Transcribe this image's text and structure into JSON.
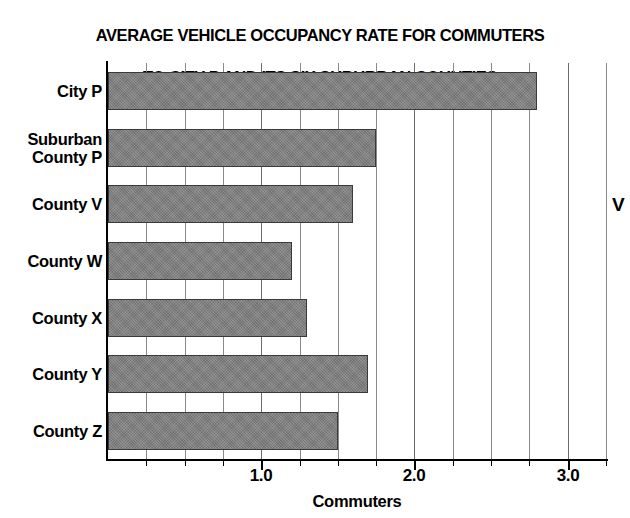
{
  "chart_data": {
    "type": "bar",
    "orientation": "horizontal",
    "title": "AVERAGE VEHICLE OCCUPANCY RATE FOR COMMUTERS TO CITY P AND ITS SIX SUBURBAN COUNTIES",
    "title_lines": [
      "AVERAGE VEHICLE OCCUPANCY RATE FOR COMMUTERS",
      "TO CITY P AND ITS SIX SUBURBAN COUNTIES"
    ],
    "categories": [
      "City P",
      "Suburban County P",
      "County V",
      "County W",
      "County X",
      "County Y",
      "County Z"
    ],
    "category_lines": [
      [
        "City P"
      ],
      [
        "Suburban",
        "County P"
      ],
      [
        "County V"
      ],
      [
        "County W"
      ],
      [
        "County X"
      ],
      [
        "County Y"
      ],
      [
        "County Z"
      ]
    ],
    "values": [
      2.8,
      1.75,
      1.6,
      1.2,
      1.3,
      1.7,
      1.5
    ],
    "xlabel": "Commuters",
    "ylabel": "",
    "xlim": [
      0,
      3.25
    ],
    "xticks": [
      1.0,
      2.0,
      3.0
    ],
    "xtick_labels": [
      "1.0",
      "2.0",
      "3.0"
    ],
    "minor_tick_step": 0.25,
    "grid": true,
    "grid_axis": "x",
    "legend": null,
    "bar_color": "#7e7e7e",
    "bar_edge_color": "#3a3a3a",
    "background_color": "#ffffff",
    "axis_color": "#000000",
    "gridline_color": "#8a8a8a"
  },
  "edge_artifact": {
    "glyph": "V"
  }
}
